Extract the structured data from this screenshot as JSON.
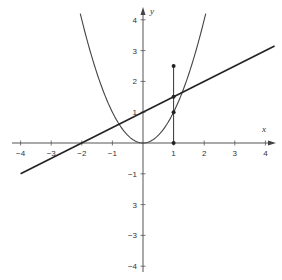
{
  "chart_data": {
    "type": "line",
    "title": "",
    "xlabel": "x",
    "ylabel": "y",
    "xlim": [
      -4,
      4
    ],
    "ylim": [
      -4,
      4
    ],
    "grid": false,
    "x_ticks": [
      -4,
      -3,
      -2,
      -1,
      1,
      2,
      3,
      4
    ],
    "y_ticks": [
      4,
      3,
      2,
      1,
      -1,
      -2,
      -3,
      -4
    ],
    "x_tick_labels": [
      "−4",
      "−3",
      "−2",
      "−1",
      "1",
      "2",
      "3",
      "4"
    ],
    "y_tick_labels": [
      "4",
      "3",
      "2",
      "1",
      "−1",
      "3",
      "−3",
      "−4"
    ],
    "series": [
      {
        "name": "parabola",
        "equation": "y = x^2",
        "x_range": [
          -2.05,
          2.05
        ],
        "color": "#444444"
      },
      {
        "name": "line",
        "equation": "y = x/2 + 1",
        "x_range": [
          -4,
          4.3
        ],
        "color": "#222222"
      },
      {
        "name": "vertical-segment",
        "x": 1,
        "y_range": [
          0,
          2.5
        ],
        "color": "#333333"
      }
    ],
    "points": [
      {
        "x": 1,
        "y": 0
      },
      {
        "x": 1,
        "y": 1
      },
      {
        "x": 1,
        "y": 1.5
      },
      {
        "x": 1,
        "y": 2.5
      }
    ]
  },
  "axes": {
    "x_label": "x",
    "y_label": "y"
  }
}
